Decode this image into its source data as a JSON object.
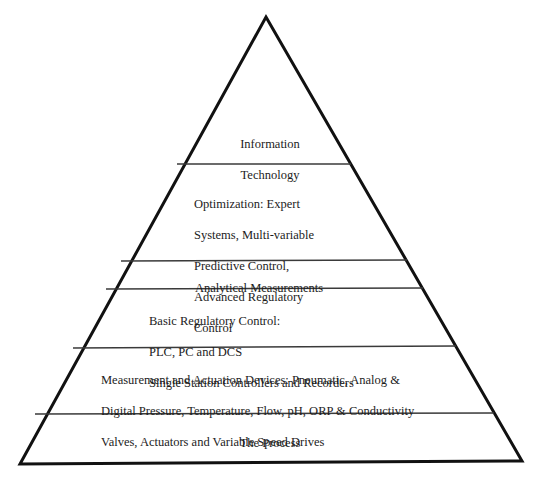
{
  "diagram": {
    "type": "pyramid",
    "colors": {
      "outline": "#111111",
      "divider": "#3a3a3a",
      "background": "#ffffff",
      "text": "#1c1c1c"
    },
    "layers": [
      {
        "id": "information-technology",
        "level": 6,
        "lines": [
          "Information",
          "Technology"
        ]
      },
      {
        "id": "optimization",
        "level": 5,
        "lines": [
          "Optimization: Expert",
          "Systems, Multi-variable",
          "Predictive Control,",
          "Advanced Regulatory",
          "Control"
        ]
      },
      {
        "id": "analytical-measurements",
        "level": 4,
        "lines": [
          "Analytical Measurements"
        ]
      },
      {
        "id": "basic-regulatory-control",
        "level": 3,
        "lines": [
          "Basic Regulatory Control:",
          "PLC, PC and DCS",
          "Single Station Controllers and Recorders"
        ]
      },
      {
        "id": "measurement-actuation-devices",
        "level": 2,
        "lines": [
          "Measurement and Actuation Devices: Pneumatic, Analog &",
          "Digital Pressure, Temperature, Flow, pH, ORP & Conductivity",
          "Valves, Actuators and Variable Speed Drives"
        ]
      },
      {
        "id": "the-process",
        "level": 1,
        "lines": [
          "The Process"
        ]
      }
    ]
  }
}
